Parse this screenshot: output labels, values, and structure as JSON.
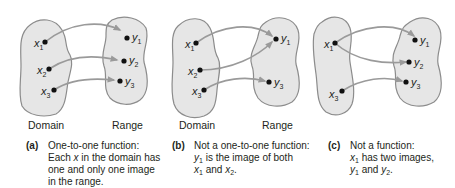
{
  "diagrams": [
    {
      "id": "a",
      "tag": "(a)",
      "domain_label": "Domain",
      "range_label": "Range",
      "domain_elements": [
        "x1",
        "x2",
        "x3"
      ],
      "range_elements": [
        "y1",
        "y2",
        "y3"
      ],
      "mappings": [
        [
          "x1",
          "y1"
        ],
        [
          "x2",
          "y2"
        ],
        [
          "x3",
          "y3"
        ]
      ],
      "caption_lines": [
        "One-to-one function:",
        "Each x in the domain has",
        "one and only one image",
        "in the range."
      ]
    },
    {
      "id": "b",
      "tag": "(b)",
      "domain_label": "Domain",
      "range_label": "Range",
      "domain_elements": [
        "x1",
        "x2",
        "x3"
      ],
      "range_elements": [
        "y1",
        "y3"
      ],
      "mappings": [
        [
          "x1",
          "y1"
        ],
        [
          "x2",
          "y1"
        ],
        [
          "x3",
          "y3"
        ]
      ],
      "caption_lines": [
        "Not a one-to-one function:",
        "y1 is the image of both",
        "x1 and x2."
      ]
    },
    {
      "id": "c",
      "tag": "(c)",
      "domain_elements": [
        "x1",
        "x3"
      ],
      "range_elements": [
        "y1",
        "y2",
        "y3"
      ],
      "mappings": [
        [
          "x1",
          "y1"
        ],
        [
          "x1",
          "y2"
        ],
        [
          "x3",
          "y3"
        ]
      ],
      "caption_lines": [
        "Not a function:",
        "x1 has two images,",
        "y1 and y2."
      ]
    }
  ],
  "labels": {
    "x": "x",
    "y": "y",
    "one": "1",
    "two": "2",
    "three": "3",
    "a_domain": "Domain",
    "a_range": "Range",
    "b_domain": "Domain",
    "b_range": "Range",
    "a_tag": "(a)",
    "b_tag": "(b)",
    "c_tag": "(c)",
    "a_l1": "One-to-one function:",
    "a_l2_pre": "Each ",
    "a_l2_x": "x",
    "a_l2_post": " in the domain has",
    "a_l3": "one and only one image",
    "a_l4": "in the range.",
    "b_l1": "Not a one-to-one function:",
    "b_l2_y": "y",
    "b_l2_sub": "1",
    "b_l2_post": " is the image of both",
    "b_l3_x1": "x",
    "b_l3_sub1": "1",
    "b_l3_mid": " and ",
    "b_l3_x2": "x",
    "b_l3_sub2": "2",
    "b_l3_end": ".",
    "c_l1": "Not a function:",
    "c_l2_x": "x",
    "c_l2_sub": "1",
    "c_l2_post": " has two images,",
    "c_l3_y1": "y",
    "c_l3_sub1": "1",
    "c_l3_mid": " and ",
    "c_l3_y2": "y",
    "c_l3_sub2": "2",
    "c_l3_end": "."
  },
  "colors": {
    "set_fill": "#e6e6e6",
    "set_stroke": "#8c8c8c",
    "arrow": "#9a9a9a",
    "dot": "#111111",
    "text": "#231f20"
  }
}
